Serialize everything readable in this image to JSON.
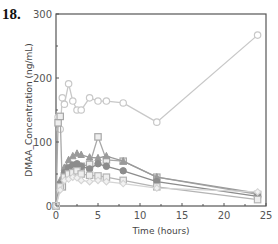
{
  "figure": {
    "number_label": "18."
  },
  "chart_data": {
    "type": "line",
    "title": "",
    "xlabel": "Time (hours)",
    "ylabel": "DMAA_Concentration (ng/mL)",
    "xlim": [
      0,
      25
    ],
    "ylim": [
      0,
      300
    ],
    "xticks": [
      0,
      5,
      10,
      15,
      20,
      25
    ],
    "yticks": [
      0,
      100,
      200,
      300
    ],
    "grid": false,
    "legend": null,
    "series": [
      {
        "name": "Subject A (circles)",
        "marker": "circle",
        "color": "#c8c8c8",
        "x": [
          0.25,
          0.5,
          0.75,
          1,
          1.5,
          2,
          2.5,
          3,
          4,
          5,
          6,
          8,
          12,
          24
        ],
        "y": [
          139,
          120,
          169,
          159,
          191,
          164,
          150,
          150,
          169,
          164,
          164,
          161,
          131,
          267
        ]
      },
      {
        "name": "Subject B (squares)",
        "marker": "square",
        "color": "#a8a8a8",
        "x": [
          0,
          0.25,
          0.5,
          0.75,
          1,
          1.5,
          2,
          2.5,
          3,
          4,
          5,
          6,
          8,
          12,
          24
        ],
        "y": [
          0,
          130,
          140,
          30,
          45,
          55,
          60,
          62,
          62,
          65,
          108,
          72,
          70,
          45,
          18
        ]
      },
      {
        "name": "Subject C (triangles)",
        "marker": "triangle",
        "color": "#9a9a9a",
        "x": [
          0,
          0.5,
          1,
          1.5,
          2,
          2.5,
          3,
          4,
          5,
          6,
          8,
          12,
          24
        ],
        "y": [
          0,
          40,
          60,
          72,
          78,
          82,
          80,
          76,
          75,
          78,
          70,
          45,
          20
        ]
      },
      {
        "name": "Subject D (filled circles)",
        "marker": "circle-filled",
        "color": "#8c8c8c",
        "x": [
          0,
          0.5,
          1,
          1.5,
          2,
          2.5,
          3,
          4,
          5,
          6,
          8,
          12,
          24
        ],
        "y": [
          0,
          35,
          52,
          60,
          64,
          66,
          62,
          58,
          66,
          62,
          55,
          38,
          15
        ]
      },
      {
        "name": "Subject E (open squares)",
        "marker": "square",
        "color": "#b4b4b4",
        "x": [
          0,
          0.5,
          1,
          1.5,
          2,
          2.5,
          3,
          4,
          5,
          6,
          8,
          12,
          24
        ],
        "y": [
          0,
          30,
          45,
          50,
          52,
          55,
          50,
          48,
          47,
          45,
          40,
          30,
          10
        ]
      },
      {
        "name": "Subject F (diamonds)",
        "marker": "diamond",
        "color": "#d4d4d4",
        "x": [
          0,
          0.5,
          1,
          1.5,
          2,
          2.5,
          3,
          4,
          5,
          6,
          8,
          12,
          24
        ],
        "y": [
          0,
          25,
          40,
          42,
          45,
          44,
          40,
          38,
          40,
          38,
          35,
          28,
          22
        ]
      }
    ]
  }
}
